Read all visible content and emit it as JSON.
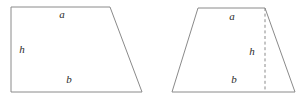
{
  "figure": {
    "canvas": {
      "width": 308,
      "height": 100,
      "background": "#ffffff"
    },
    "stroke_color": "#8a8a8a",
    "label_color": "#2b2b2b",
    "shapes": [
      {
        "id": "right-trapezoid",
        "name": "Right-angled trapezoid",
        "points": "11,7 110,7 142,92 11,92",
        "labels": [
          {
            "id": "a",
            "text": "a",
            "x": 62,
            "y": 15,
            "meaning": "top side"
          },
          {
            "id": "h",
            "text": "h",
            "x": 22,
            "y": 50,
            "meaning": "height"
          },
          {
            "id": "b",
            "text": "b",
            "x": 69,
            "y": 80,
            "meaning": "bottom side"
          }
        ],
        "height_line": null
      },
      {
        "id": "isosceles-trapezoid",
        "name": "Isosceles trapezoid",
        "points": "198,8 265,8 295,92 172,92",
        "labels": [
          {
            "id": "a",
            "text": "a",
            "x": 232,
            "y": 17,
            "meaning": "top side"
          },
          {
            "id": "h",
            "text": "h",
            "x": 252,
            "y": 52,
            "meaning": "height"
          },
          {
            "id": "b",
            "text": "b",
            "x": 234,
            "y": 80,
            "meaning": "bottom side"
          }
        ],
        "height_line": {
          "x1": 265,
          "y1": 8,
          "x2": 265,
          "y2": 92
        }
      }
    ]
  }
}
